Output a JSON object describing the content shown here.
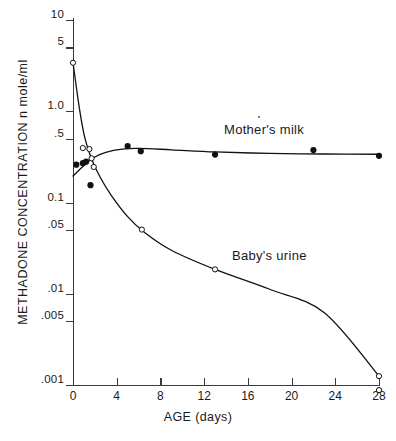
{
  "chart_data": {
    "type": "scatter",
    "title": "",
    "xlabel": "AGE (days)",
    "ylabel": "METHADONE  CONCENTRATION   n mole/ml",
    "x_scale": "linear",
    "y_scale": "log",
    "xlim": [
      0,
      28
    ],
    "ylim": [
      0.001,
      10
    ],
    "grid": false,
    "legend_position": "inline-annotations",
    "xticks": [
      0,
      4,
      8,
      12,
      16,
      20,
      24,
      28
    ],
    "xtick_labels": [
      "0",
      "4",
      "8",
      "12",
      "16",
      "20",
      "24",
      "28"
    ],
    "yticks": [
      10,
      5,
      1.0,
      0.5,
      0.1,
      0.05,
      0.01,
      0.005,
      0.001
    ],
    "ytick_labels": [
      "10",
      "5",
      "1.0",
      ".5",
      "0.1",
      ".05",
      ".01",
      ".005",
      ".001"
    ],
    "series": [
      {
        "name": "Mother's milk",
        "marker": "filled-circle",
        "color": "#111111",
        "points": [
          {
            "x": 0.3,
            "y": 0.26
          },
          {
            "x": 0.9,
            "y": 0.27
          },
          {
            "x": 1.2,
            "y": 0.28
          },
          {
            "x": 1.6,
            "y": 0.155
          },
          {
            "x": 5.0,
            "y": 0.415
          },
          {
            "x": 6.2,
            "y": 0.365
          },
          {
            "x": 13.0,
            "y": 0.335
          },
          {
            "x": 22.0,
            "y": 0.375
          },
          {
            "x": 28.0,
            "y": 0.325
          }
        ],
        "curve": [
          {
            "x": 0.0,
            "y": 0.195
          },
          {
            "x": 1.0,
            "y": 0.255
          },
          {
            "x": 2.0,
            "y": 0.315
          },
          {
            "x": 3.0,
            "y": 0.355
          },
          {
            "x": 4.5,
            "y": 0.385
          },
          {
            "x": 6.0,
            "y": 0.392
          },
          {
            "x": 9.0,
            "y": 0.378
          },
          {
            "x": 13.0,
            "y": 0.358
          },
          {
            "x": 18.0,
            "y": 0.345
          },
          {
            "x": 23.0,
            "y": 0.34
          },
          {
            "x": 28.0,
            "y": 0.338
          }
        ]
      },
      {
        "name": "Baby's urine",
        "marker": "open-circle",
        "color": "#111111",
        "points": [
          {
            "x": 0.0,
            "y": 3.4
          },
          {
            "x": 0.9,
            "y": 0.395
          },
          {
            "x": 1.5,
            "y": 0.385
          },
          {
            "x": 1.7,
            "y": 0.305
          },
          {
            "x": 1.9,
            "y": 0.245
          },
          {
            "x": 6.3,
            "y": 0.0505
          },
          {
            "x": 13.0,
            "y": 0.0185
          },
          {
            "x": 28.0,
            "y": 0.00125
          },
          {
            "x": 28.0,
            "y": 0.00088
          }
        ],
        "curve": [
          {
            "x": 0.0,
            "y": 3.4
          },
          {
            "x": 0.6,
            "y": 1.05
          },
          {
            "x": 1.1,
            "y": 0.5
          },
          {
            "x": 1.7,
            "y": 0.3
          },
          {
            "x": 2.5,
            "y": 0.188
          },
          {
            "x": 3.5,
            "y": 0.12
          },
          {
            "x": 5.0,
            "y": 0.07
          },
          {
            "x": 6.5,
            "y": 0.0475
          },
          {
            "x": 9.0,
            "y": 0.03
          },
          {
            "x": 13.0,
            "y": 0.0185
          },
          {
            "x": 18.0,
            "y": 0.0112
          },
          {
            "x": 23.0,
            "y": 0.0062
          },
          {
            "x": 28.0,
            "y": 0.00125
          }
        ]
      }
    ],
    "annotations": [
      {
        "text": "Mother's milk",
        "x": 17.0,
        "y": 0.62
      },
      {
        "text": "Baby's urine",
        "x": 18.0,
        "y": 0.03
      }
    ]
  }
}
